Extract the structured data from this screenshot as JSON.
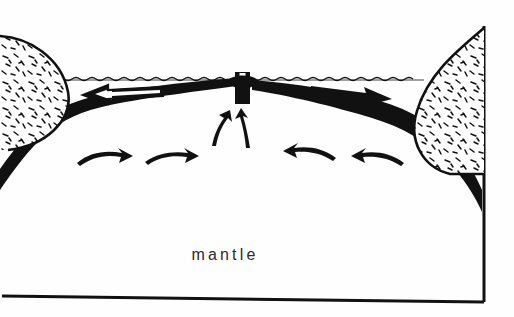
{
  "figure": {
    "name": "seafloor-spreading-cross-section",
    "background_color": "#fefefe",
    "ink_color": "#000000",
    "label_color": "#2b2b2b"
  },
  "labels": {
    "mantle": "mantle"
  },
  "features": {
    "sea_surface": "wavy-sea-surface-line",
    "ridge": "mid-ocean-ridge-crest",
    "rift": "axial-rift-notch",
    "lithosphere": "lithosphere-slab-band",
    "left_continent": "left-continental-block",
    "right_continent": "right-continental-block",
    "frame": "diagram-frame-border"
  },
  "arrows": [
    {
      "id": "spreading-arrow-left",
      "direction": "left",
      "style": "outline",
      "region": "upper-plate"
    },
    {
      "id": "spreading-arrow-right",
      "direction": "right",
      "style": "solid",
      "region": "upper-plate"
    },
    {
      "id": "upwelling-arrow-left",
      "direction": "up",
      "style": "solid",
      "region": "beneath-ridge"
    },
    {
      "id": "upwelling-arrow-right",
      "direction": "up",
      "style": "solid",
      "region": "beneath-ridge"
    },
    {
      "id": "convection-arrow-left-outer",
      "direction": "right",
      "style": "thin",
      "region": "mantle"
    },
    {
      "id": "convection-arrow-left-inner",
      "direction": "right",
      "style": "thin",
      "region": "mantle"
    },
    {
      "id": "convection-arrow-right-inner",
      "direction": "left",
      "style": "thin",
      "region": "mantle"
    },
    {
      "id": "convection-arrow-right-outer",
      "direction": "left",
      "style": "thin",
      "region": "mantle"
    }
  ]
}
